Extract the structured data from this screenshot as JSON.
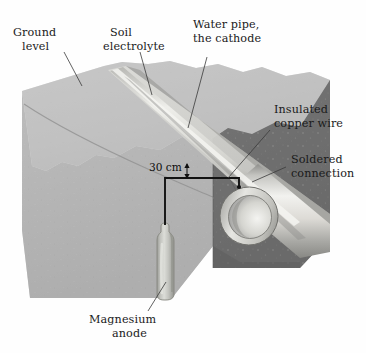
{
  "figure": {
    "background_color": "#fefefe",
    "width": 366,
    "height": 353
  },
  "labels": {
    "ground_level": {
      "line1": "Ground",
      "line2": "level"
    },
    "soil_electrolyte": {
      "line1": "Soil",
      "line2": "electrolyte"
    },
    "water_pipe": {
      "line1": "Water pipe,",
      "line2": "the cathode"
    },
    "insulated_wire": {
      "line1": "Insulated",
      "line2": "copper wire"
    },
    "soldered_connection": {
      "line1": "Soldered",
      "line2": "connection"
    },
    "magnesium_anode": {
      "line1": "Magnesium",
      "line2": "anode"
    },
    "dimension": {
      "value": "30 cm"
    }
  },
  "colors": {
    "soil_top": "#c3c3c3",
    "soil_left_face": "#b5b5b5",
    "soil_right_face": "#6e6e6e",
    "pipe_light": "#e9e9e6",
    "pipe_shadow": "#9a9a98",
    "anode_body": "#b9bab5",
    "anode_highlight": "#d8d9d4",
    "wire_black": "#121212",
    "label_text": "#1a1a1a",
    "leader_line": "#3a3a3a",
    "trench_fill": "#d2d2cf"
  },
  "elements": {
    "soil_block": "cutaway-soil-block",
    "trench": "pipe-trench",
    "pipe": "water-pipe-cathode",
    "pipe_opening": "pipe-end-opening",
    "anode": "magnesium-anode-bottle",
    "wire": "insulated-copper-wire-path",
    "solder_point": "soldered-connection-point",
    "dimension_marker": "depth-dimension-30cm"
  }
}
